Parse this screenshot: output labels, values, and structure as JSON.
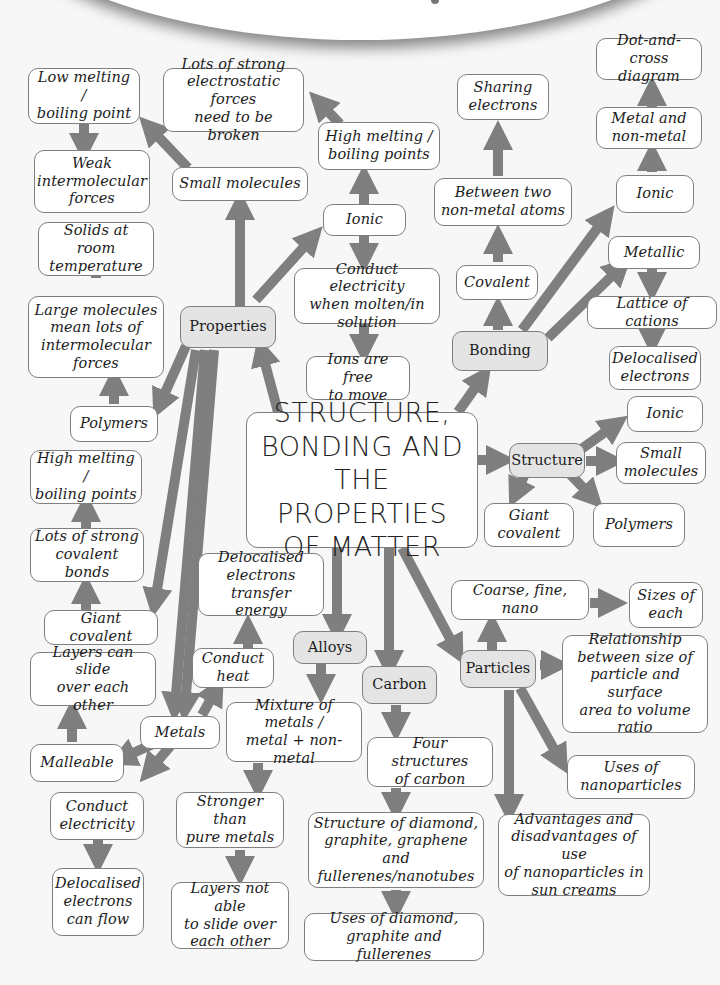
{
  "title": "STRUCTURE,\nBONDING AND\nTHE PROPERTIES\nOF MATTER",
  "colors": {
    "arrow": "#7f7f7f",
    "hub_fill": "#e4e4e4",
    "box_fill": "#ffffff",
    "border": "#7f7f7f",
    "background": "#f7f7f7"
  },
  "hubs": {
    "properties": "Properties",
    "bonding": "Bonding",
    "structure": "Structure",
    "alloys": "Alloys",
    "carbon": "Carbon",
    "particles": "Particles"
  },
  "properties_branch": {
    "small_molecules": "Small molecules",
    "low_melting": "Low melting /\nboiling point",
    "weak_forces": "Weak\nintermolecular\nforces",
    "ionic": "Ionic",
    "high_melting_ionic": "High melting /\nboiling points",
    "strong_electrostatic": "Lots of strong\nelectrostatic forces\nneed to be broken",
    "conduct_molten": "Conduct electricity\nwhen molten/in\nsolution",
    "ions_free": "Ions are free\nto move",
    "polymers": "Polymers",
    "large_molecules": "Large molecules\nmean lots of\nintermolecular\nforces",
    "solids_room_temp": "Solids at room\ntemperature",
    "giant_covalent": "Giant covalent",
    "strong_covalent": "Lots of strong\ncovalent bonds",
    "high_melting_gc": "High melting /\nboiling points",
    "metals": "Metals",
    "malleable": "Malleable",
    "layers_slide": "Layers can slide\nover each other",
    "conduct_heat": "Conduct\nheat",
    "deloc_transfer": "Delocalised\nelectrons transfer\nenergy",
    "conduct_electricity": "Conduct\nelectricity",
    "deloc_flow": "Delocalised\nelectrons\ncan flow"
  },
  "bonding_branch": {
    "covalent": "Covalent",
    "between_nonmetals": "Between two\nnon-metal atoms",
    "sharing_electrons": "Sharing\nelectrons",
    "ionic": "Ionic",
    "metal_nonmetal": "Metal and\nnon-metal",
    "dot_cross": "Dot-and-cross\ndiagram",
    "metallic": "Metallic",
    "lattice_cations": "Lattice of cations",
    "delocalised_electrons": "Delocalised\nelectrons"
  },
  "structure_branch": {
    "ionic": "Ionic",
    "small_molecules": "Small\nmolecules",
    "polymers": "Polymers",
    "giant_covalent": "Giant\ncovalent"
  },
  "alloys_branch": {
    "mixture": "Mixture of metals /\nmetal + non-metal",
    "stronger": "Stronger than\npure metals",
    "layers_not_slide": "Layers not able\nto slide over\neach other"
  },
  "carbon_branch": {
    "four_structures": "Four structures\nof carbon",
    "structure_of": "Structure of diamond,\ngraphite, graphene and\nfullerenes/nanotubes",
    "uses_of": "Uses of diamond,\ngraphite and fullerenes"
  },
  "particles_branch": {
    "coarse_fine_nano": "Coarse, fine, nano",
    "sizes_each": "Sizes of\neach",
    "relationship": "Relationship\nbetween size of\nparticle and surface\narea to volume\nratio",
    "uses_nano": "Uses of\nnanoparticles",
    "advantages": "Advantages and\ndisadvantages of use\nof nanoparticles in\nsun creams"
  }
}
